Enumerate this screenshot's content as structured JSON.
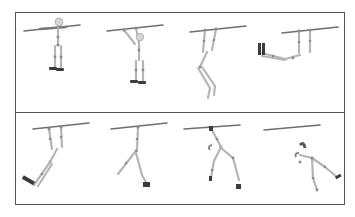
{
  "figure": {
    "rows": [
      {
        "name": "top-row",
        "frames": [
          {
            "label": "frame-1",
            "pose": "hanging straight, arms along bar"
          },
          {
            "label": "frame-2",
            "pose": "hanging by both hands, legs straight"
          },
          {
            "label": "frame-3",
            "pose": "swinging, legs trailing back"
          },
          {
            "label": "frame-4",
            "pose": "body horizontal, legs extended left"
          }
        ]
      },
      {
        "name": "bottom-row",
        "frames": [
          {
            "label": "frame-5",
            "pose": "swinging forward, legs kicked left"
          },
          {
            "label": "frame-6",
            "pose": "one hand on bar, legs swinging"
          },
          {
            "label": "frame-7",
            "pose": "one hand on bar, body twisting"
          },
          {
            "label": "frame-8",
            "pose": "released from bar, falling"
          }
        ]
      }
    ],
    "colors": {
      "bar": "#6e6e6e",
      "bone": "#b8b8b8",
      "joint": "#8a8a8a",
      "foot": "#3a3a3a",
      "border": "#555555"
    }
  }
}
